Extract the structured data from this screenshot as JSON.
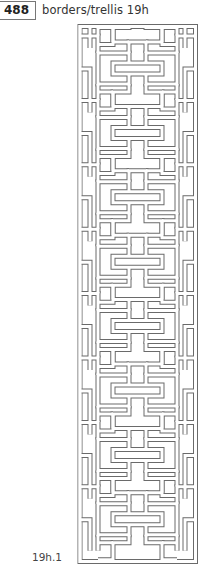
{
  "header": {
    "page_number": "488",
    "section_title": "borders/trellis  19h"
  },
  "figure": {
    "caption": "19h.1",
    "icon": "trellis-lattice-pattern",
    "line_color": "#6a6a6a",
    "fill_color": "#ffffff",
    "frame": {
      "x": 78,
      "y": 25,
      "width": 119,
      "height": 538
    },
    "tile_period_px": 64.4,
    "tile_count": 8
  }
}
